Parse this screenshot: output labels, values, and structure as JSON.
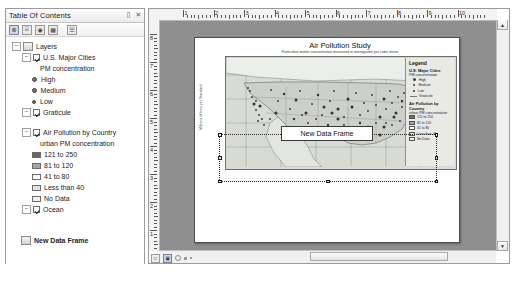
{
  "toc": {
    "title": "Table Of Contents",
    "pin_icon": "pin-icon",
    "close_icon": "close-icon",
    "toolbar": [
      {
        "name": "list-by-drawing-order-icon",
        "glyph": "≣"
      },
      {
        "name": "list-by-source-icon",
        "glyph": "⌸"
      },
      {
        "name": "list-by-visibility-icon",
        "glyph": "◉"
      },
      {
        "name": "list-by-selection-icon",
        "glyph": "▦"
      },
      {
        "name": "options-icon",
        "glyph": "☰"
      }
    ],
    "root": "Layers",
    "items": [
      {
        "label": "U.S. Major Cities",
        "checked": true
      },
      {
        "label": "PM concentration"
      },
      {
        "label": "High"
      },
      {
        "label": "Medium"
      },
      {
        "label": "Low"
      },
      {
        "label": "Graticule",
        "checked": true
      },
      {
        "label": "Air Pollution by Country",
        "checked": true
      },
      {
        "label": "urban PM concentration"
      },
      {
        "label": "121 to 250",
        "color": "#696969"
      },
      {
        "label": "81 to 120",
        "color": "#a5a5a5"
      },
      {
        "label": "41 to 80",
        "color": "#ffffff"
      },
      {
        "label": "Less than 40",
        "color": "#e3e3e3"
      },
      {
        "label": "No Data",
        "color": "#f2f2f2"
      },
      {
        "label": "Ocean",
        "checked": true
      },
      {
        "label": "New Data Frame"
      }
    ]
  },
  "rulers": {
    "horizontal_ticks": [
      "1",
      "2",
      "3",
      "4",
      "5",
      "6",
      "7",
      "8",
      "9",
      "10"
    ],
    "vertical_ticks": [
      "8",
      "7",
      "6",
      "5",
      "4",
      "3",
      "2",
      "1"
    ]
  },
  "page": {
    "vertical_note": "Millions of tons per Standard",
    "map": {
      "title": "Air Pollution Study",
      "subtitle": "Particulate matter concentration measured in micrograms per cubic meter"
    },
    "legend": {
      "title": "Legend",
      "cities_header": "U.S. Major Cities",
      "cities_sub": "PM concentration",
      "classes": [
        "High",
        "Medium",
        "Low"
      ],
      "graticule": "Graticule",
      "country_header": "Air Pollution by Country",
      "country_sub": "urban PM concentration",
      "ranges": [
        {
          "label": "121 to 250",
          "color": "#6b6b6b"
        },
        {
          "label": "81 to 120",
          "color": "#a6a6a6"
        },
        {
          "label": "41 to 80",
          "color": "#ffffff"
        },
        {
          "label": "Less than 40",
          "color": "#dcdcdc"
        },
        {
          "label": "No Data",
          "color": "#efefef"
        }
      ]
    },
    "data_frame_label": "New Data Frame"
  },
  "statusbar": {
    "layout_view_icon": "layout-view-icon",
    "data_view_icon": "data-view-icon",
    "refresh_icon": "refresh-icon"
  }
}
